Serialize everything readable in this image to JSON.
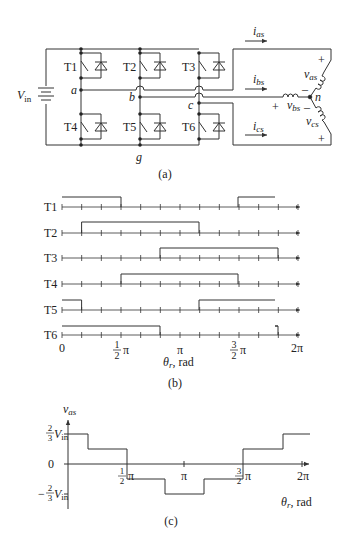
{
  "figure": {
    "panel_a": {
      "caption": "(a)",
      "source_label": "V",
      "source_sub": "in",
      "switches": [
        "T1",
        "T2",
        "T3",
        "T4",
        "T5",
        "T6"
      ],
      "nodes": {
        "a": "a",
        "b": "b",
        "c": "c",
        "g": "g",
        "n": "n"
      },
      "currents": [
        {
          "sym": "i",
          "sub": "as"
        },
        {
          "sym": "i",
          "sub": "bs"
        },
        {
          "sym": "i",
          "sub": "cs"
        }
      ],
      "voltages": [
        {
          "sym": "v",
          "sub": "as"
        },
        {
          "sym": "v",
          "sub": "bs"
        },
        {
          "sym": "v",
          "sub": "cs"
        }
      ],
      "plus": "+",
      "minus": "–"
    },
    "panel_b": {
      "caption": "(b)",
      "rows": [
        "T1",
        "T2",
        "T3",
        "T4",
        "T5",
        "T6"
      ],
      "x_ticks": [
        "0",
        "π",
        "2π"
      ],
      "x_frac_half": {
        "num": "1",
        "den": "2",
        "pi": "π"
      },
      "x_frac_three_half": {
        "num": "3",
        "den": "2",
        "pi": "π"
      },
      "xlabel_sym": "θ",
      "xlabel_sub": "r",
      "xlabel_unit": ", rad"
    },
    "panel_c": {
      "caption": "(c)",
      "ylabel_sym": "v",
      "ylabel_sub": "as",
      "y_top": {
        "num": "2",
        "den": "3",
        "V": "V",
        "sub": "in"
      },
      "y_zero": "0",
      "y_bot": {
        "sign": "−",
        "num": "2",
        "den": "3",
        "V": "V",
        "sub": "in"
      },
      "x_half": {
        "num": "1",
        "den": "2",
        "pi": "π"
      },
      "x_pi": "π",
      "x_three_half": {
        "num": "3",
        "den": "2",
        "pi": "π"
      },
      "x_two_pi": "2π",
      "xlabel_sym": "θ",
      "xlabel_sub": "r",
      "xlabel_unit": ", rad"
    }
  },
  "chart_data": [
    {
      "type": "line",
      "title": "(b) Switch gating signals",
      "xlabel": "theta_r, rad",
      "x_ticks": [
        "0",
        "1/2 pi",
        "pi",
        "3/2 pi",
        "2 pi"
      ],
      "x_units": "sixths of pi (12 intervals over 0..2pi, each pi/6)",
      "series": [
        {
          "name": "T1",
          "on_intervals_deg": [
            [
              0,
              90
            ],
            [
              270,
              360
            ]
          ]
        },
        {
          "name": "T2",
          "on_intervals_deg": [
            [
              30,
              210
            ]
          ]
        },
        {
          "name": "T3",
          "on_intervals_deg": [
            [
              150,
              330
            ]
          ]
        },
        {
          "name": "T4",
          "on_intervals_deg": [
            [
              90,
              270
            ]
          ]
        },
        {
          "name": "T5",
          "on_intervals_deg": [
            [
              0,
              30
            ],
            [
              210,
              360
            ]
          ]
        },
        {
          "name": "T6",
          "on_intervals_deg": [
            [
              0,
              150
            ],
            [
              330,
              360
            ]
          ]
        }
      ]
    },
    {
      "type": "line",
      "title": "(c) Phase voltage v_as",
      "xlabel": "theta_r, rad",
      "ylabel": "v_as",
      "y_ticks": [
        "-2/3 Vin",
        "0",
        "2/3 Vin"
      ],
      "x_ticks": [
        "1/2 pi",
        "pi",
        "3/2 pi",
        "2 pi"
      ],
      "step_points_deg": [
        {
          "from": 0,
          "to": 30,
          "value": "2/3 Vin"
        },
        {
          "from": 30,
          "to": 90,
          "value": "1/3 Vin"
        },
        {
          "from": 90,
          "to": 150,
          "value": "-1/3 Vin"
        },
        {
          "from": 150,
          "to": 210,
          "value": "-2/3 Vin"
        },
        {
          "from": 210,
          "to": 270,
          "value": "-1/3 Vin"
        },
        {
          "from": 270,
          "to": 330,
          "value": "1/3 Vin"
        },
        {
          "from": 330,
          "to": 360,
          "value": "2/3 Vin"
        }
      ]
    }
  ]
}
